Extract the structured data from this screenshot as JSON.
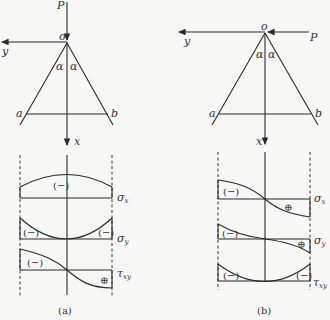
{
  "figure_a": {
    "caption": "(a)",
    "labels": {
      "P": "P",
      "o": "o",
      "y": "y",
      "x": "x",
      "a": "a",
      "b": "b",
      "alpha": "α"
    },
    "stress_labels": {
      "sx": "σ",
      "sx_sub": "x",
      "sy": "σ",
      "sy_sub": "y",
      "txy": "τ",
      "txy_sub": "xy"
    },
    "signs": {
      "sx": "(−)",
      "sy_left": "(−)",
      "sy_right": "(−)",
      "txy_neg": "(−)",
      "txy_pos": "⊕"
    }
  },
  "figure_b": {
    "caption": "(b)",
    "labels": {
      "P": "P",
      "o": "o",
      "y": "y",
      "x": "x",
      "a": "a",
      "b": "b",
      "alpha": "α"
    },
    "stress_labels": {
      "sx": "σ",
      "sx_sub": "x",
      "sy": "σ",
      "sy_sub": "y",
      "txy": "τ",
      "txy_sub": "xy"
    },
    "signs": {
      "sx_neg": "(−)",
      "sx_pos": "⊕",
      "sy_neg": "(−)",
      "sy_pos": "⊕",
      "txy_left": "(−)",
      "txy_right": "(−)"
    }
  }
}
